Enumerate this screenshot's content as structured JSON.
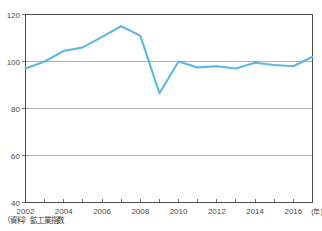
{
  "chart_data": {
    "type": "line",
    "title": "",
    "subtitle": "",
    "xlabel": "(年)",
    "ylabel": "",
    "x": [
      2002,
      2003,
      2004,
      2005,
      2006,
      2007,
      2008,
      2009,
      2010,
      2011,
      2012,
      2013,
      2014,
      2015,
      2016,
      2017
    ],
    "series": [
      {
        "name": "鉱工業指数",
        "color": "#5cb8e2",
        "values": [
          97,
          100,
          104.5,
          106,
          110.5,
          115,
          111,
          86.5,
          100,
          97.5,
          98,
          97,
          99.5,
          98.5,
          98,
          102
        ]
      }
    ],
    "xlim": [
      2002,
      2017
    ],
    "ylim": [
      40,
      120
    ],
    "yticks": [
      40,
      60,
      80,
      100,
      120
    ],
    "ytick_labels": [
      "40",
      "60",
      "80",
      "100",
      "120"
    ],
    "xticks": [
      2002,
      2004,
      2006,
      2008,
      2010,
      2012,
      2014,
      2016
    ],
    "xtick_labels": [
      "2002",
      "2004",
      "2006",
      "2008",
      "2010",
      "2012",
      "2014",
      "2016"
    ],
    "xtick_minor": [
      2003,
      2005,
      2007,
      2009,
      2011,
      2013,
      2015,
      2017
    ],
    "grid": "horizontal",
    "legend": "none",
    "x_axis_unit": "(年)"
  },
  "source_note": "（資料）鉱工業指数"
}
